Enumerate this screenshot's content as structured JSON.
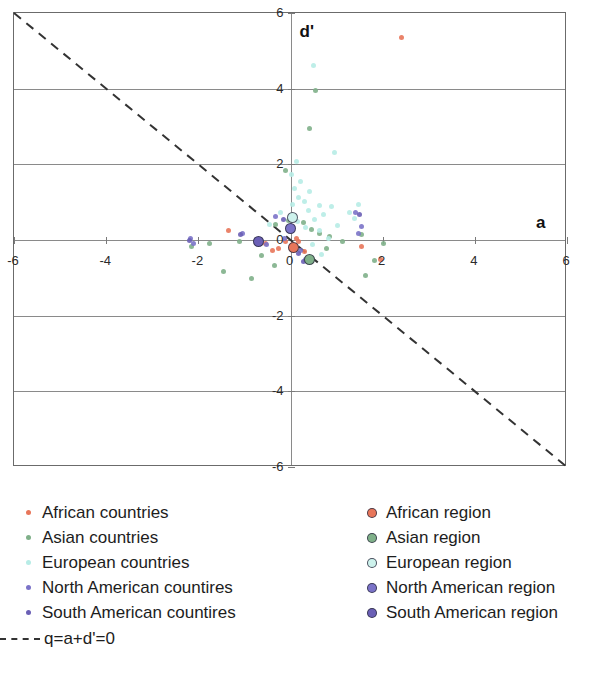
{
  "axes": {
    "x_title": "a",
    "y_title": "d'",
    "x_ticks": [
      "-6",
      "-4",
      "-2",
      "0",
      "2",
      "4",
      "6"
    ],
    "y_ticks": [
      "6",
      "4",
      "2",
      "0",
      "-2",
      "-4",
      "-6"
    ]
  },
  "legend": {
    "countries": [
      {
        "label": "African countries",
        "color": "#e8765a",
        "marker": "small-dot"
      },
      {
        "label": "Asian countries",
        "color": "#7fb089",
        "marker": "small-dot"
      },
      {
        "label": "European countries",
        "color": "#b7ece6",
        "marker": "small-dot"
      },
      {
        "label": "North American countires",
        "color": "#7b73c8",
        "marker": "small-dot"
      },
      {
        "label": "South American countires",
        "color": "#6a5fb5",
        "marker": "small-dot"
      }
    ],
    "regions": [
      {
        "label": "African region",
        "color": "#e8765a",
        "marker": "ringed-dot"
      },
      {
        "label": "Asian region",
        "color": "#7fb089",
        "marker": "ringed-dot"
      },
      {
        "label": "European region",
        "color": "#cdf2ec",
        "marker": "ringed-dot"
      },
      {
        "label": "North American region",
        "color": "#7b73c8",
        "marker": "ringed-dot"
      },
      {
        "label": "South American region",
        "color": "#6a5fb5",
        "marker": "ringed-dot"
      }
    ],
    "line_label": "q=a+d'=0"
  },
  "chart_data": {
    "type": "scatter",
    "title": "",
    "xlabel": "a",
    "ylabel": "d'",
    "xlim": [
      -6,
      6
    ],
    "ylim": [
      -6,
      6
    ],
    "grid": true,
    "legend_position": "below",
    "annotations": [
      {
        "text": "q=a+d'=0",
        "type": "reference-line",
        "equation": "d' = -a",
        "style": "dashed",
        "color": "#333333"
      }
    ],
    "series": [
      {
        "name": "African countries",
        "color": "#e8765a",
        "marker": "small-dot",
        "points": [
          [
            2.4,
            5.35
          ],
          [
            -1.35,
            0.25
          ],
          [
            -0.55,
            -0.1
          ],
          [
            -0.25,
            -0.22
          ],
          [
            -0.1,
            -0.05
          ],
          [
            0.05,
            -0.12
          ],
          [
            0.18,
            -0.05
          ],
          [
            0.3,
            -0.3
          ],
          [
            1.55,
            -0.18
          ],
          [
            1.95,
            -0.52
          ],
          [
            0.12,
            0.04
          ],
          [
            -0.38,
            -0.28
          ]
        ]
      },
      {
        "name": "Asian countries",
        "color": "#7fb089",
        "marker": "small-dot",
        "points": [
          [
            0.55,
            3.95
          ],
          [
            0.42,
            2.95
          ],
          [
            -0.1,
            1.85
          ],
          [
            -0.32,
            0.42
          ],
          [
            -0.05,
            0.52
          ],
          [
            0.28,
            0.45
          ],
          [
            0.45,
            0.28
          ],
          [
            0.62,
            0.18
          ],
          [
            -2.15,
            -0.18
          ],
          [
            -1.75,
            -0.1
          ],
          [
            -1.1,
            -0.05
          ],
          [
            -0.62,
            -0.42
          ],
          [
            -0.35,
            -0.68
          ],
          [
            -1.45,
            -0.82
          ],
          [
            -0.85,
            -1.02
          ],
          [
            0.85,
            0.1
          ],
          [
            1.12,
            -0.05
          ],
          [
            1.55,
            0.15
          ],
          [
            1.82,
            -0.55
          ],
          [
            1.62,
            -0.95
          ],
          [
            2.02,
            -0.08
          ],
          [
            0.78,
            -0.22
          ]
        ]
      },
      {
        "name": "European countries",
        "color": "#b7ece6",
        "marker": "small-dot",
        "points": [
          [
            0.5,
            4.6
          ],
          [
            0.95,
            2.32
          ],
          [
            0.12,
            2.08
          ],
          [
            0.02,
            1.72
          ],
          [
            0.22,
            1.55
          ],
          [
            0.08,
            1.35
          ],
          [
            0.42,
            1.28
          ],
          [
            0.18,
            1.12
          ],
          [
            0.3,
            1.02
          ],
          [
            0.05,
            0.95
          ],
          [
            0.62,
            0.92
          ],
          [
            0.88,
            0.88
          ],
          [
            0.38,
            0.78
          ],
          [
            -0.22,
            0.72
          ],
          [
            0.72,
            0.68
          ],
          [
            1.28,
            0.72
          ],
          [
            1.38,
            0.58
          ],
          [
            0.52,
            0.55
          ],
          [
            0.15,
            0.48
          ],
          [
            -0.45,
            0.42
          ],
          [
            0.32,
            0.32
          ],
          [
            0.62,
            0.25
          ],
          [
            0.82,
            0.05
          ],
          [
            0.48,
            -0.12
          ],
          [
            0.68,
            -0.38
          ],
          [
            0.35,
            -0.55
          ],
          [
            1.48,
            0.95
          ],
          [
            1.02,
            0.38
          ]
        ]
      },
      {
        "name": "North American countires",
        "color": "#7b73c8",
        "marker": "small-dot",
        "points": [
          [
            -2.18,
            0.05
          ],
          [
            -2.1,
            -0.08
          ],
          [
            -1.05,
            0.18
          ],
          [
            -0.65,
            0.02
          ],
          [
            -0.32,
            0.62
          ],
          [
            -0.12,
            0.05
          ],
          [
            0.05,
            0.58
          ],
          [
            0.22,
            -0.28
          ],
          [
            0.32,
            -0.52
          ],
          [
            1.42,
            0.72
          ],
          [
            1.55,
            0.35
          ],
          [
            1.48,
            0.18
          ],
          [
            -0.52,
            -0.12
          ]
        ]
      },
      {
        "name": "South American countires",
        "color": "#6a5fb5",
        "marker": "small-dot",
        "points": [
          [
            -2.2,
            -0.02
          ],
          [
            -1.08,
            0.15
          ],
          [
            -0.72,
            -0.02
          ],
          [
            -0.15,
            0.55
          ],
          [
            0.18,
            -0.35
          ],
          [
            0.28,
            -0.58
          ],
          [
            1.5,
            0.68
          ]
        ]
      },
      {
        "name": "African region",
        "color": "#e8765a",
        "marker": "ringed-dot",
        "points": [
          [
            0.05,
            -0.18
          ]
        ]
      },
      {
        "name": "Asian region",
        "color": "#7fb089",
        "marker": "ringed-dot",
        "points": [
          [
            0.38,
            -0.48
          ]
        ]
      },
      {
        "name": "European region",
        "color": "#cdf2ec",
        "marker": "ringed-dot",
        "points": [
          [
            0.02,
            0.62
          ]
        ]
      },
      {
        "name": "North American region",
        "color": "#7b73c8",
        "marker": "ringed-dot",
        "points": [
          [
            -0.02,
            0.32
          ]
        ]
      },
      {
        "name": "South American region",
        "color": "#6a5fb5",
        "marker": "ringed-dot",
        "points": [
          [
            -0.72,
            -0.02
          ]
        ]
      }
    ]
  }
}
